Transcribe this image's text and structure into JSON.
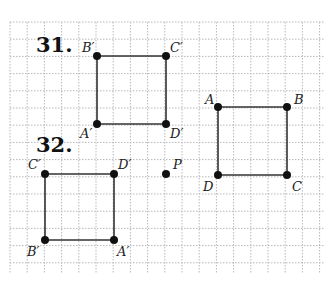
{
  "grid": {
    "x0": 10,
    "y0": 22,
    "x1": 324,
    "y1": 274,
    "spacing": 17.2,
    "color": "#b8b8b8"
  },
  "problems": [
    {
      "number": "31.",
      "pos": [
        36,
        52
      ]
    },
    {
      "number": "32.",
      "pos": [
        36,
        152
      ]
    }
  ],
  "figures": [
    {
      "name": "square-31-image",
      "points": [
        {
          "label": "B′",
          "x": 97,
          "y": 56,
          "lx": 82,
          "ly": 52
        },
        {
          "label": "C′",
          "x": 166,
          "y": 56,
          "lx": 170,
          "ly": 52
        },
        {
          "label": "D′",
          "x": 166,
          "y": 124,
          "lx": 170,
          "ly": 138
        },
        {
          "label": "A′",
          "x": 97,
          "y": 124,
          "lx": 80,
          "ly": 138
        }
      ]
    },
    {
      "name": "square-abcd",
      "points": [
        {
          "label": "A",
          "x": 218,
          "y": 107,
          "lx": 205,
          "ly": 104
        },
        {
          "label": "B",
          "x": 287,
          "y": 107,
          "lx": 294,
          "ly": 104
        },
        {
          "label": "C",
          "x": 287,
          "y": 175,
          "lx": 292,
          "ly": 191
        },
        {
          "label": "D",
          "x": 218,
          "y": 175,
          "lx": 203,
          "ly": 191
        }
      ]
    },
    {
      "name": "square-32-image",
      "points": [
        {
          "label": "C′",
          "x": 45,
          "y": 174,
          "lx": 28,
          "ly": 169
        },
        {
          "label": "D′",
          "x": 114,
          "y": 174,
          "lx": 118,
          "ly": 169
        },
        {
          "label": "A′",
          "x": 114,
          "y": 240,
          "lx": 117,
          "ly": 256
        },
        {
          "label": "B′",
          "x": 45,
          "y": 240,
          "lx": 27,
          "ly": 256
        }
      ]
    }
  ],
  "center_point": {
    "label": "P",
    "x": 166,
    "y": 174,
    "lx": 173,
    "ly": 169
  }
}
